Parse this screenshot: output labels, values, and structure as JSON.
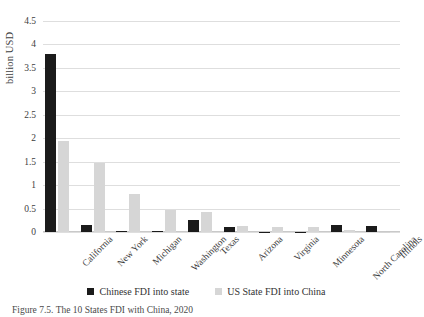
{
  "chart_data": {
    "type": "bar",
    "title": "",
    "xlabel": "",
    "ylabel": "billion USD",
    "ylim": [
      0,
      4.5
    ],
    "ytick_step": 0.5,
    "yticks": [
      "4.5",
      "4",
      "3.5",
      "3",
      "2.5",
      "2",
      "1.5",
      "1",
      "0.5",
      "0"
    ],
    "grid": true,
    "legend_position": "bottom-center",
    "categories": [
      "California",
      "New York",
      "Michigan",
      "Washington",
      "Texas",
      "Arizona",
      "Virginia",
      "Minnesota",
      "North Carolina",
      "Illinois"
    ],
    "series": [
      {
        "name": "Chinese FDI into state",
        "color": "#1b1b1b",
        "values": [
          3.79,
          0.15,
          0.02,
          0.02,
          0.26,
          0.1,
          0.01,
          0.01,
          0.14,
          0.13
        ]
      },
      {
        "name": "US State FDI into China",
        "color": "#d6d6d6",
        "values": [
          1.95,
          1.48,
          0.82,
          0.47,
          0.42,
          0.12,
          0.1,
          0.1,
          0.05,
          0.01
        ]
      }
    ]
  },
  "axes": {
    "y_title": "billion USD"
  },
  "caption": {
    "text": "Figure 7.5. The 10 States FDI with China, 2020"
  },
  "colors": {
    "series_black": "#1b1b1b",
    "series_gray": "#d6d6d6",
    "gridline": "#dedede",
    "text": "#3a3a3a",
    "background": "#ffffff"
  }
}
